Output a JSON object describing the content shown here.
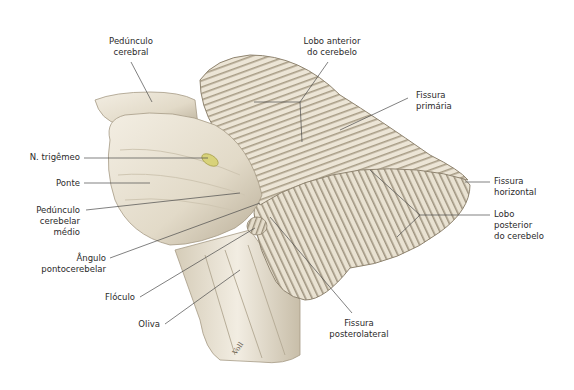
{
  "figure": {
    "signature": "Voll"
  },
  "labels": {
    "pedunculo_cerebral": [
      "Pedúnculo",
      "cerebral"
    ],
    "lobo_anterior": [
      "Lobo anterior",
      "do cerebelo"
    ],
    "fissura_primaria": [
      "Fissura",
      "primária"
    ],
    "n_trigemeo": [
      "N. trigêmeo"
    ],
    "ponte": [
      "Ponte"
    ],
    "pedunculo_cerebelar_medio": [
      "Pedúnculo",
      "cerebelar",
      "médio"
    ],
    "angulo_pontocerebelar": [
      "Ângulo",
      "pontocerebelar"
    ],
    "floculo": [
      "Flóculo"
    ],
    "oliva": [
      "Oliva"
    ],
    "fissura_horizontal": [
      "Fissura",
      "horizontal"
    ],
    "lobo_posterior": [
      "Lobo",
      "posterior",
      "do cerebelo"
    ],
    "fissura_posterolateral": [
      "Fissura",
      "posterolateral"
    ]
  },
  "colors": {
    "tissue_light": "#efe9dc",
    "tissue_mid": "#d9d0bd",
    "tissue_shadow": "#8f8470",
    "leader_line": "#4a4a4a",
    "trigeminal": "#d8d27a"
  }
}
